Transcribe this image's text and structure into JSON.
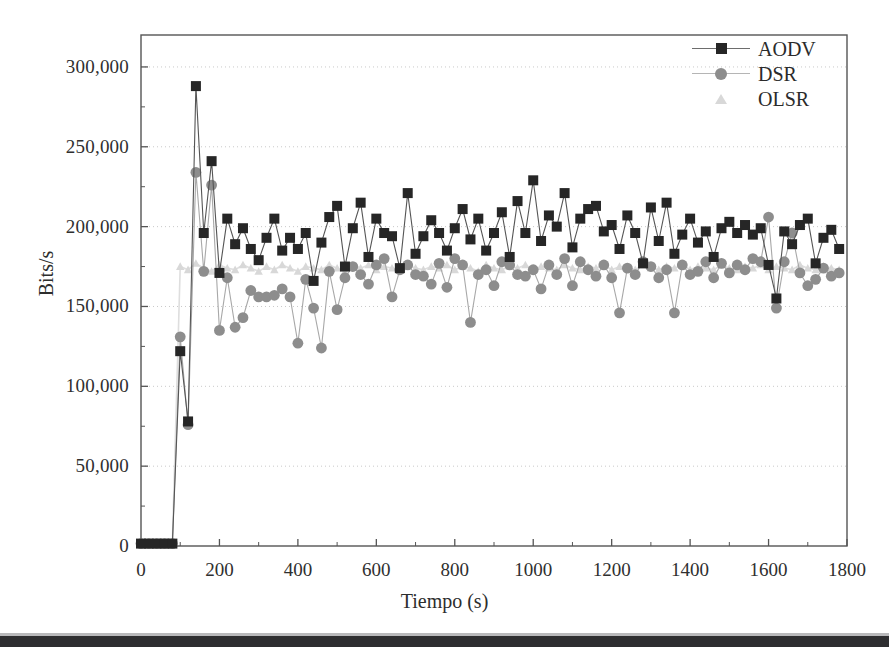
{
  "figure": {
    "background_color": "#ffffff",
    "frame_color": "#555555",
    "grid_color": "#c9c9c9"
  },
  "legend": {
    "entries": [
      {
        "label": "AODV",
        "marker": "filled-square-marker",
        "color": "#262626",
        "has_line": true
      },
      {
        "label": "DSR",
        "marker": "filled-circle-marker",
        "color": "#8d8d8d",
        "has_line": true
      },
      {
        "label": "OLSR",
        "marker": "filled-triangle-marker",
        "color": "#d8d8d8",
        "has_line": false
      }
    ]
  },
  "scan_artifact": {
    "label": "page-edge-bar",
    "color": "#2e2e30"
  },
  "chart_data": {
    "type": "line",
    "title": "",
    "subtitle": "",
    "xlabel": "Tiempo (s)",
    "ylabel": "Bits/s",
    "xlim": [
      0,
      1800
    ],
    "ylim": [
      0,
      320000
    ],
    "xticks": [
      0,
      200,
      400,
      600,
      800,
      1000,
      1200,
      1400,
      1600,
      1800
    ],
    "xticklabels": [
      "0",
      "200",
      "400",
      "600",
      "800",
      "1000",
      "1200",
      "1400",
      "1600",
      "1800"
    ],
    "yticks": [
      0,
      50000,
      100000,
      150000,
      200000,
      250000,
      300000
    ],
    "yticklabels": [
      "0",
      "50,000",
      "100,000",
      "150,000",
      "200,000",
      "250,000",
      "300,000"
    ],
    "x_minor_tick_interval": 100,
    "y_minor_tick_interval": 25000,
    "grid": "horizontal-dotted-at-major-yticks",
    "legend_position": "top-right-inside",
    "x": [
      0,
      20,
      40,
      60,
      80,
      100,
      120,
      140,
      160,
      180,
      200,
      220,
      240,
      260,
      280,
      300,
      320,
      340,
      360,
      380,
      400,
      420,
      440,
      460,
      480,
      500,
      520,
      540,
      560,
      580,
      600,
      620,
      640,
      660,
      680,
      700,
      720,
      740,
      760,
      780,
      800,
      820,
      840,
      860,
      880,
      900,
      920,
      940,
      960,
      980,
      1000,
      1020,
      1040,
      1060,
      1080,
      1100,
      1120,
      1140,
      1160,
      1180,
      1200,
      1220,
      1240,
      1260,
      1280,
      1300,
      1320,
      1340,
      1360,
      1380,
      1400,
      1420,
      1440,
      1460,
      1480,
      1500,
      1520,
      1540,
      1560,
      1580,
      1600,
      1620,
      1640,
      1660,
      1680,
      1700,
      1720,
      1740,
      1760,
      1780
    ],
    "series": [
      {
        "name": "AODV",
        "marker": "square",
        "color": "#262626",
        "line_color": "#555555",
        "values": [
          1500,
          1500,
          1500,
          1500,
          1500,
          122000,
          78000,
          288000,
          196000,
          241000,
          171000,
          205000,
          189000,
          199000,
          186000,
          179000,
          193000,
          205000,
          185000,
          193000,
          186000,
          196000,
          166000,
          190000,
          206000,
          213000,
          175000,
          199000,
          215000,
          181000,
          205000,
          196000,
          194000,
          174000,
          221000,
          183000,
          194000,
          204000,
          196000,
          185000,
          199000,
          211000,
          192000,
          205000,
          185000,
          196000,
          209000,
          181000,
          216000,
          196000,
          229000,
          191000,
          207000,
          200000,
          221000,
          187000,
          205000,
          211000,
          213000,
          197000,
          201000,
          186000,
          207000,
          196000,
          177000,
          212000,
          191000,
          215000,
          183000,
          195000,
          205000,
          190000,
          197000,
          181000,
          199000,
          203000,
          196000,
          201000,
          195000,
          199000,
          176000,
          155000,
          197000,
          189000,
          201000,
          205000,
          177000,
          193000,
          198000,
          186000
        ]
      },
      {
        "name": "DSR",
        "marker": "circle",
        "color": "#8d8d8d",
        "line_color": "#a8a8a8",
        "values": [
          1500,
          1500,
          1500,
          1500,
          1500,
          131000,
          76000,
          234000,
          172000,
          226000,
          135000,
          168000,
          137000,
          143000,
          160000,
          156000,
          156000,
          157000,
          161000,
          156000,
          127000,
          167000,
          149000,
          124000,
          172000,
          148000,
          168000,
          175000,
          170000,
          164000,
          176000,
          180000,
          156000,
          173000,
          176000,
          170000,
          169000,
          164000,
          177000,
          162000,
          180000,
          176000,
          140000,
          170000,
          173000,
          163000,
          178000,
          176000,
          170000,
          169000,
          173000,
          161000,
          176000,
          170000,
          180000,
          163000,
          178000,
          173000,
          169000,
          176000,
          168000,
          146000,
          174000,
          170000,
          178000,
          175000,
          168000,
          173000,
          146000,
          176000,
          170000,
          172000,
          178000,
          168000,
          177000,
          171000,
          176000,
          173000,
          180000,
          178000,
          206000,
          149000,
          178000,
          196000,
          171000,
          163000,
          167000,
          174000,
          169000,
          171000
        ]
      },
      {
        "name": "OLSR",
        "marker": "triangle",
        "color": "#d8d8d8",
        "line_color": "#dedede",
        "values": [
          1500,
          1500,
          1500,
          1500,
          1500,
          175000,
          173000,
          177000,
          174000,
          172000,
          176000,
          174000,
          173000,
          176000,
          174000,
          172000,
          175000,
          173000,
          176000,
          174000,
          172000,
          175000,
          174000,
          173000,
          176000,
          174000,
          172000,
          175000,
          174000,
          176000,
          173000,
          175000,
          174000,
          173000,
          176000,
          174000,
          173000,
          175000,
          174000,
          176000,
          173000,
          175000,
          174000,
          172000,
          176000,
          174000,
          173000,
          175000,
          174000,
          176000,
          173000,
          175000,
          174000,
          173000,
          176000,
          174000,
          173000,
          175000,
          174000,
          176000,
          173000,
          175000,
          174000,
          173000,
          176000,
          174000,
          173000,
          175000,
          174000,
          176000,
          173000,
          175000,
          174000,
          173000,
          176000,
          174000,
          173000,
          175000,
          174000,
          176000,
          173000,
          175000,
          174000,
          173000,
          176000,
          174000,
          173000,
          175000,
          174000,
          173000
        ]
      }
    ]
  }
}
